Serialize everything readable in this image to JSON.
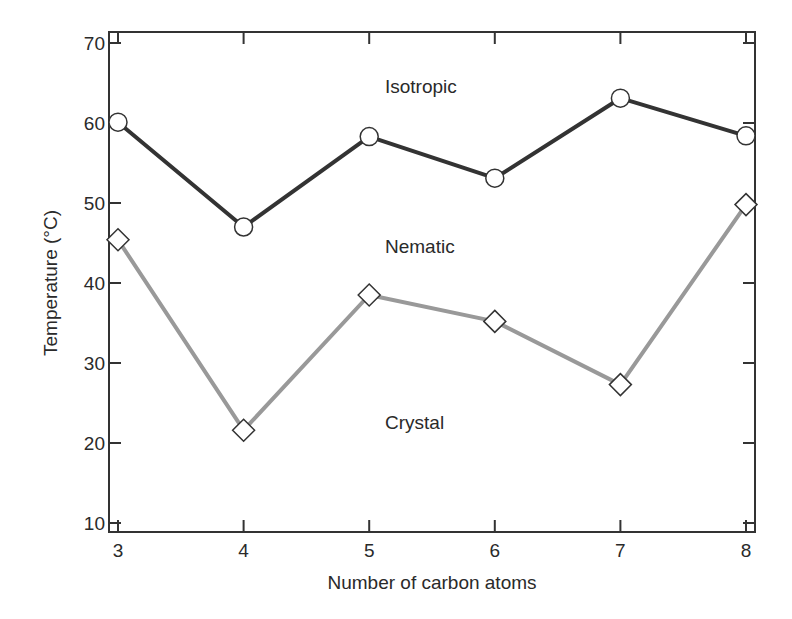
{
  "chart_data": {
    "type": "line",
    "title": "",
    "xlabel": "Number of carbon atoms",
    "ylabel": "Temperature (°C)",
    "x": [
      3,
      4,
      5,
      6,
      7,
      8
    ],
    "xlim": [
      3,
      8
    ],
    "ylim": [
      10,
      70
    ],
    "xticks": [
      "3",
      "4",
      "5",
      "6",
      "7",
      "8"
    ],
    "yticks": [
      "10",
      "20",
      "30",
      "40",
      "50",
      "60",
      "70"
    ],
    "grid": false,
    "legend": "none",
    "series": [
      {
        "name": "Isotropic transition (nematic–isotropic)",
        "marker": "circle",
        "color": "#333333",
        "values": [
          60.1,
          47.0,
          58.3,
          53.1,
          63.1,
          58.4
        ]
      },
      {
        "name": "Nematic transition (crystal–nematic)",
        "marker": "diamond",
        "color": "#999999",
        "values": [
          45.4,
          21.6,
          38.5,
          35.2,
          27.3,
          49.8
        ]
      }
    ],
    "annotations": [
      {
        "text": "Isotropic",
        "x": 5.2,
        "y": 64.5
      },
      {
        "text": "Nematic",
        "x": 5.2,
        "y": 44.5
      },
      {
        "text": "Crystal",
        "x": 5.2,
        "y": 25.2
      }
    ]
  },
  "labels": {
    "xlabel": "Number of carbon atoms",
    "ylabel": "Temperature (°C)",
    "isotropic": "Isotropic",
    "nematic": "Nematic",
    "crystal": "Crystal"
  }
}
